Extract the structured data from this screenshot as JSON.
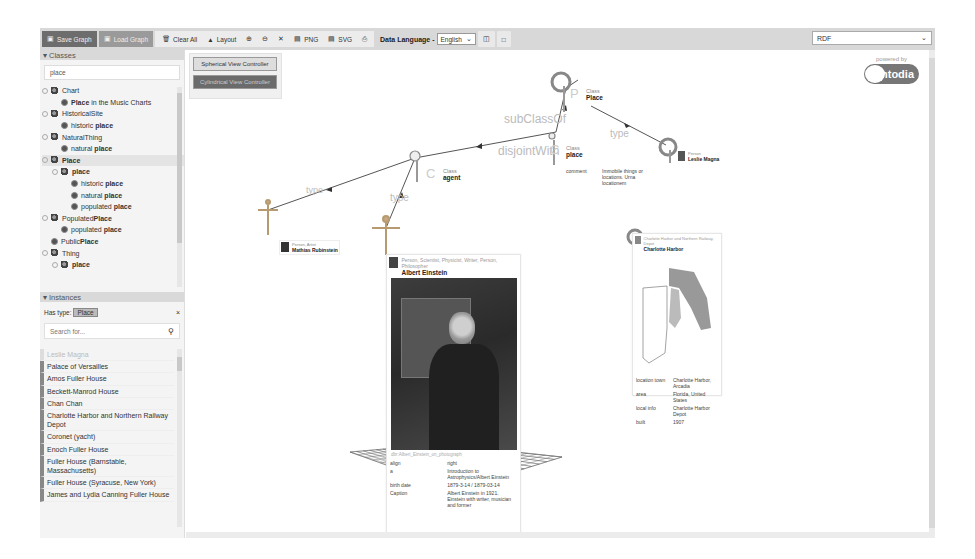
{
  "toolbar": {
    "save_label": "Save Graph",
    "open_label": "Load Graph",
    "clear_all_label": "Clear All",
    "layout_label": "Layout",
    "zoom_in_label": "⊕",
    "zoom_out_label": "⊖",
    "fullscreen_label": "✕",
    "png_label": "PNG",
    "svg_label": "SVG",
    "print_label": "⎙",
    "data_language_label": "Data Language -",
    "data_language_value": "English",
    "rdf_select_value": "RDF"
  },
  "classes": {
    "header": "Classes",
    "filter_value": "place",
    "items": [
      {
        "level": 0,
        "toggle": true,
        "icon": "class-icon",
        "pre": "",
        "bold": "",
        "post": "Chart"
      },
      {
        "level": 1,
        "toggle": false,
        "icon": "dot-icon",
        "pre": "",
        "bold": "Place",
        "post": " in the Music Charts"
      },
      {
        "level": 0,
        "toggle": true,
        "icon": "class-icon",
        "pre": "HistoricalSite",
        "bold": "",
        "post": ""
      },
      {
        "level": 1,
        "toggle": false,
        "icon": "dot-icon",
        "pre": "historic ",
        "bold": "place",
        "post": ""
      },
      {
        "level": 0,
        "toggle": true,
        "icon": "class-icon",
        "pre": "NaturalThing",
        "bold": "",
        "post": ""
      },
      {
        "level": 1,
        "toggle": false,
        "icon": "dot-icon",
        "pre": "natural ",
        "bold": "place",
        "post": ""
      },
      {
        "level": 0,
        "toggle": true,
        "icon": "class-icon",
        "pre": "",
        "bold": "Place",
        "post": "",
        "selected": true
      },
      {
        "level": 1,
        "toggle": true,
        "icon": "class-icon",
        "pre": "",
        "bold": "place",
        "post": ""
      },
      {
        "level": 2,
        "toggle": false,
        "icon": "dot-icon",
        "pre": "historic ",
        "bold": "place",
        "post": ""
      },
      {
        "level": 2,
        "toggle": false,
        "icon": "dot-icon",
        "pre": "natural ",
        "bold": "place",
        "post": ""
      },
      {
        "level": 2,
        "toggle": false,
        "icon": "dot-icon",
        "pre": "populated ",
        "bold": "place",
        "post": ""
      },
      {
        "level": 0,
        "toggle": true,
        "icon": "class-icon",
        "pre": "Populated",
        "bold": "Place",
        "post": ""
      },
      {
        "level": 1,
        "toggle": false,
        "icon": "dot-icon",
        "pre": "populated ",
        "bold": "place",
        "post": ""
      },
      {
        "level": 0,
        "toggle": false,
        "icon": "dot-icon",
        "pre": "Public",
        "bold": "Place",
        "post": ""
      },
      {
        "level": 0,
        "toggle": true,
        "icon": "class-icon",
        "pre": "Thing",
        "bold": "",
        "post": ""
      },
      {
        "level": 1,
        "toggle": true,
        "icon": "class-icon",
        "pre": "",
        "bold": "place",
        "post": ""
      }
    ]
  },
  "instances": {
    "header": "Instances",
    "has_type_label": "Has type:",
    "has_type_value": "Place",
    "clear_label": "×",
    "search_placeholder": "Search for...",
    "items": [
      {
        "label": "Leslie Magna",
        "faded": true
      },
      {
        "label": "Palace of Versailles"
      },
      {
        "label": "Amos Fuller House"
      },
      {
        "label": "Beckett-Manrod House"
      },
      {
        "label": "Chan Chan"
      },
      {
        "label": "Charlotte Harbor and Northern Railway Depot"
      },
      {
        "label": "Coronet (yacht)"
      },
      {
        "label": "Enoch Fuller House"
      },
      {
        "label": "Fuller House (Barnstable, Massachusetts)"
      },
      {
        "label": "Fuller House (Syracuse, New York)"
      },
      {
        "label": "James and Lydia Canning Fuller House"
      }
    ]
  },
  "graph": {
    "controller_buttons": [
      "Spherical View Controller",
      "Cylindrical View Controller"
    ],
    "powered_by": "powered by",
    "logo_text": "ntodia",
    "edge_labels": {
      "subclass": "subClassOf",
      "type_top": "type",
      "disjoint": "disjointWith",
      "type_left": "type",
      "type_mid": "type"
    },
    "nodes": {
      "place_class": {
        "letter": "P",
        "caption": "Class",
        "name": "Place"
      },
      "place_sub": {
        "letter": "C",
        "caption": "Class",
        "name": "place",
        "prop_key": "comment",
        "prop_val": "Immobile things or locations. Urna locationem"
      },
      "agent": {
        "letter": "C",
        "caption": "Class",
        "name": "agent"
      },
      "leslie": {
        "caption": "Leslie Magna",
        "name": "Leslie Magna"
      },
      "mathias": {
        "caption": "Mathias Rubinstein",
        "name": "Mathias Rubinstein"
      },
      "charlotte": {
        "caption": "Charlotte Harbor and Northern Railway",
        "name": "Charlotte Harbor"
      }
    },
    "einstein_card": {
      "caption": "Person, Scientist, Physicist, Writer, Person, Philosopher",
      "title": "Albert Einstein",
      "url_caption": "dbr:Albert_Einstein_on_photograph",
      "props": [
        {
          "k": "align",
          "v": "right"
        },
        {
          "k": "a",
          "v": "Introduction to Astrophysics/Albert Einstein"
        },
        {
          "k": "birth date",
          "v": "1879-3-14 / 1879-03-14"
        },
        {
          "k": "Caption",
          "v": "Albert Einstein in 1921. Einstein with writer, musician and former"
        }
      ]
    },
    "charlotte_card": {
      "caption": "Charlotte Harbor and Northern Railway, Depot",
      "title": "Charlotte Harbor",
      "props": [
        {
          "k": "location town",
          "v": "Charlotte Harbor, Arcadia"
        },
        {
          "k": "area",
          "v": "Florida, United States"
        },
        {
          "k": "local info",
          "v": "Charlotte Harbor Depot"
        },
        {
          "k": "built",
          "v": "1907"
        }
      ]
    }
  }
}
